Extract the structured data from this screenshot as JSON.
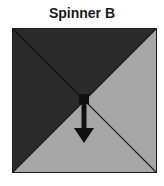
{
  "title": "Spinner B",
  "spinner": {
    "shape": "square",
    "sections": [
      {
        "position": "top",
        "color": "#2b2b2b"
      },
      {
        "position": "left",
        "color": "#2b2b2b"
      },
      {
        "position": "right",
        "color": "#a6a6a6"
      },
      {
        "position": "bottom",
        "color": "#a6a6a6"
      }
    ],
    "arrow": {
      "direction": "down",
      "color": "#111111"
    },
    "divider_color": "#111111",
    "border_color": "#1a1a1a"
  }
}
